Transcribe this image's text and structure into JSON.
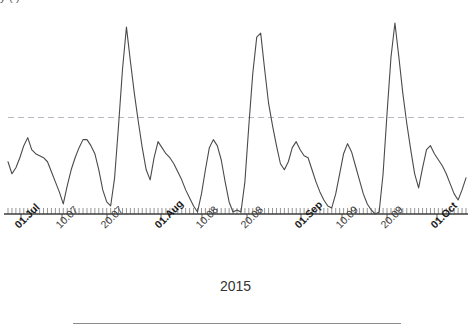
{
  "figure": {
    "title_fragment": "y                    (                 )",
    "width": 471,
    "height": 330
  },
  "axis": {
    "x_title": "2015",
    "tick_labels": [
      {
        "text": "01.Jul",
        "major": true,
        "x": 12
      },
      {
        "text": "10.07",
        "major": false,
        "x": 53
      },
      {
        "text": "20.07",
        "major": false,
        "x": 98
      },
      {
        "text": "01.Aug",
        "major": true,
        "x": 152
      },
      {
        "text": "10.08",
        "major": false,
        "x": 193
      },
      {
        "text": "20.08",
        "major": false,
        "x": 238
      },
      {
        "text": "01.Sep",
        "major": true,
        "x": 292
      },
      {
        "text": "10.09",
        "major": false,
        "x": 333
      },
      {
        "text": "20.09",
        "major": false,
        "x": 378
      },
      {
        "text": "01.Oct",
        "major": true,
        "x": 428
      }
    ]
  },
  "colors": {
    "series_line": "#4a4a4a",
    "axis_line": "#3c3c3c",
    "tick_minor": "#7a7a7a",
    "tick_major": "#5a5a5a",
    "threshold_line": "#b9b9c4",
    "footer_rule": "#8c8c8c",
    "background": "#ffffff"
  },
  "chart_data": {
    "type": "line",
    "title": "",
    "subtitle": "",
    "xlabel": "2015",
    "ylabel": "",
    "grid": false,
    "legend": "none",
    "x_is_date": true,
    "x_range": [
      "2015-07-01",
      "2015-10-03"
    ],
    "xtick_labels": [
      "01.Jul",
      "10.07",
      "20.07",
      "01.Aug",
      "10.08",
      "20.08",
      "01.Sep",
      "10.09",
      "20.09",
      "01.Oct"
    ],
    "ylim": [
      0,
      100
    ],
    "annotations": [
      {
        "type": "hline",
        "label": "threshold",
        "value": 48,
        "style": "dashed",
        "color": "#b9b9c4"
      }
    ],
    "series": [
      {
        "name": "daily value",
        "style": "solid",
        "color": "#4a4a4a",
        "values": [
          26,
          20,
          23,
          28,
          34,
          38,
          32,
          30,
          29,
          28,
          26,
          21,
          16,
          11,
          5,
          14,
          22,
          28,
          33,
          37,
          37,
          34,
          30,
          22,
          12,
          6,
          4,
          18,
          44,
          72,
          93,
          76,
          60,
          46,
          33,
          22,
          17,
          28,
          36,
          33,
          30,
          28,
          25,
          21,
          17,
          12,
          8,
          4,
          1,
          10,
          22,
          33,
          37,
          34,
          27,
          16,
          6,
          1,
          2,
          1,
          16,
          44,
          70,
          88,
          90,
          72,
          55,
          44,
          34,
          25,
          22,
          26,
          33,
          36,
          32,
          29,
          28,
          22,
          16,
          11,
          7,
          4,
          3,
          10,
          20,
          30,
          35,
          31,
          24,
          17,
          10,
          5,
          2,
          0,
          1,
          20,
          50,
          78,
          95,
          78,
          60,
          45,
          32,
          20,
          13,
          23,
          32,
          34,
          30,
          27,
          24,
          20,
          15,
          10,
          7,
          12,
          18
        ],
        "x": [
          "2015-07-01",
          "2015-07-02",
          "2015-07-03",
          "2015-07-04",
          "2015-07-05",
          "2015-07-06",
          "2015-07-07",
          "2015-07-08",
          "2015-07-09",
          "2015-07-10",
          "2015-07-11",
          "2015-07-12",
          "2015-07-13",
          "2015-07-14",
          "2015-07-15",
          "2015-07-16",
          "2015-07-17",
          "2015-07-18",
          "2015-07-19",
          "2015-07-20",
          "2015-07-21",
          "2015-07-22",
          "2015-07-23",
          "2015-07-24",
          "2015-07-25",
          "2015-07-26",
          "2015-07-27",
          "2015-07-28",
          "2015-07-29",
          "2015-07-30",
          "2015-07-31",
          "2015-08-01",
          "2015-08-02",
          "2015-08-03",
          "2015-08-04",
          "2015-08-05",
          "2015-08-06",
          "2015-08-07",
          "2015-08-08",
          "2015-08-09",
          "2015-08-10",
          "2015-08-11",
          "2015-08-12",
          "2015-08-13",
          "2015-08-14",
          "2015-08-15",
          "2015-08-16",
          "2015-08-17",
          "2015-08-18",
          "2015-08-19",
          "2015-08-20",
          "2015-08-21",
          "2015-08-22",
          "2015-08-23",
          "2015-08-24",
          "2015-08-25",
          "2015-08-26",
          "2015-08-27",
          "2015-08-28",
          "2015-08-29",
          "2015-08-30",
          "2015-08-31",
          "2015-09-01",
          "2015-09-02",
          "2015-09-03",
          "2015-09-04",
          "2015-09-05",
          "2015-09-06",
          "2015-09-07",
          "2015-09-08",
          "2015-09-09",
          "2015-09-10",
          "2015-09-11",
          "2015-09-12",
          "2015-09-13",
          "2015-09-14",
          "2015-09-15",
          "2015-09-16",
          "2015-09-17",
          "2015-09-18",
          "2015-09-19",
          "2015-09-20",
          "2015-09-21",
          "2015-09-22",
          "2015-09-23",
          "2015-09-24",
          "2015-09-25",
          "2015-09-26",
          "2015-09-27",
          "2015-09-28",
          "2015-09-29",
          "2015-09-30",
          "2015-10-01",
          "2015-10-02",
          "2015-10-03",
          "2015-10-04",
          "2015-10-05",
          "2015-10-06",
          "2015-10-07",
          "2015-10-08",
          "2015-10-09",
          "2015-10-10",
          "2015-10-11",
          "2015-10-12",
          "2015-10-13",
          "2015-10-14",
          "2015-10-15",
          "2015-10-16",
          "2015-10-17",
          "2015-10-18",
          "2015-10-19",
          "2015-10-20",
          "2015-10-21",
          "2015-10-22",
          "2015-10-23",
          "2015-10-24",
          "2015-10-25"
        ]
      }
    ]
  }
}
